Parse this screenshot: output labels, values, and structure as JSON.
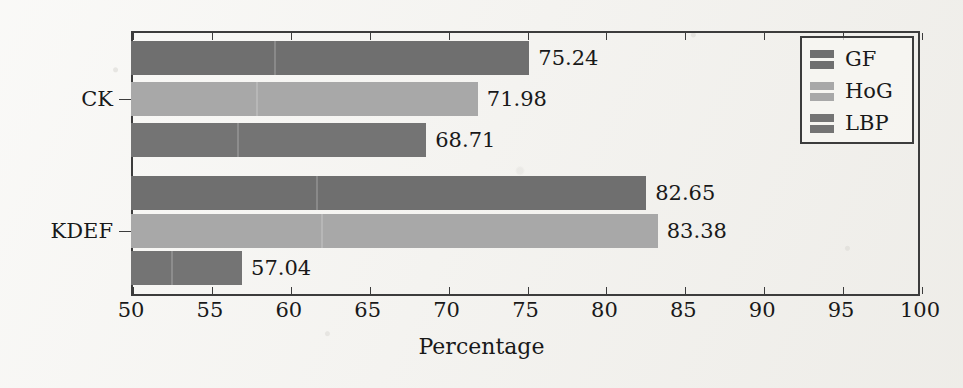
{
  "chart_data": {
    "type": "bar",
    "orientation": "horizontal",
    "title": "",
    "xlabel": "Percentage",
    "ylabel": "",
    "xlim": [
      50,
      100
    ],
    "xticks": [
      50,
      55,
      60,
      65,
      70,
      75,
      80,
      85,
      90,
      95,
      100
    ],
    "grid": false,
    "legend_position": "top-right",
    "categories": [
      "CK",
      "KDEF"
    ],
    "series": [
      {
        "name": "GF",
        "color": "#6f6f6f",
        "values": [
          75.24,
          82.65
        ]
      },
      {
        "name": "HoG",
        "color": "#a8a8a8",
        "values": [
          71.98,
          83.38
        ]
      },
      {
        "name": "LBP",
        "color": "#747474",
        "values": [
          68.71,
          57.04
        ]
      }
    ],
    "bar_labels": {
      "CK": {
        "GF": "75.24",
        "HoG": "71.98",
        "LBP": "68.71"
      },
      "KDEF": {
        "GF": "82.65",
        "HoG": "83.38",
        "LBP": "57.04"
      }
    }
  },
  "axis": {
    "x_title": "Percentage",
    "x_tick_labels": [
      "50",
      "55",
      "60",
      "65",
      "70",
      "75",
      "80",
      "85",
      "90",
      "95",
      "100"
    ],
    "y_tick_labels": [
      "CK",
      "KDEF"
    ]
  },
  "legend": {
    "entries": [
      {
        "label": "GF",
        "color": "#6f6f6f"
      },
      {
        "label": "HoG",
        "color": "#a8a8a8"
      },
      {
        "label": "LBP",
        "color": "#747474"
      }
    ]
  }
}
